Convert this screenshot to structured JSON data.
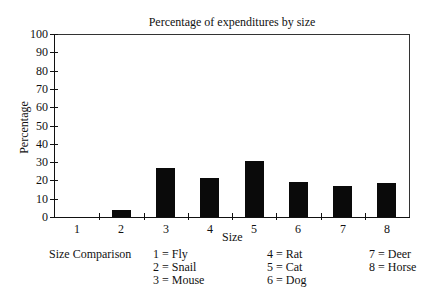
{
  "chart_data": {
    "type": "bar",
    "title": "Percentage of expenditures by size",
    "xlabel": "Size",
    "ylabel": "Percentage",
    "categories": [
      "1",
      "2",
      "3",
      "4",
      "5",
      "6",
      "7",
      "8"
    ],
    "values": [
      0,
      4,
      27,
      21.5,
      30.5,
      19.3,
      16.8,
      18.6
    ],
    "ylim": [
      0,
      100
    ],
    "yticks": [
      0,
      10,
      20,
      30,
      40,
      50,
      60,
      70,
      80,
      90,
      100
    ],
    "grid": false,
    "bar_color": "#0a0a0a"
  },
  "legend": {
    "title": "Size Comparison",
    "items": [
      {
        "label": "1 = Fly"
      },
      {
        "label": "2 = Snail"
      },
      {
        "label": "3 = Mouse"
      },
      {
        "label": "4 = Rat"
      },
      {
        "label": "5 = Cat"
      },
      {
        "label": "6 = Dog"
      },
      {
        "label": "7 = Deer"
      },
      {
        "label": "8 = Horse"
      }
    ]
  }
}
